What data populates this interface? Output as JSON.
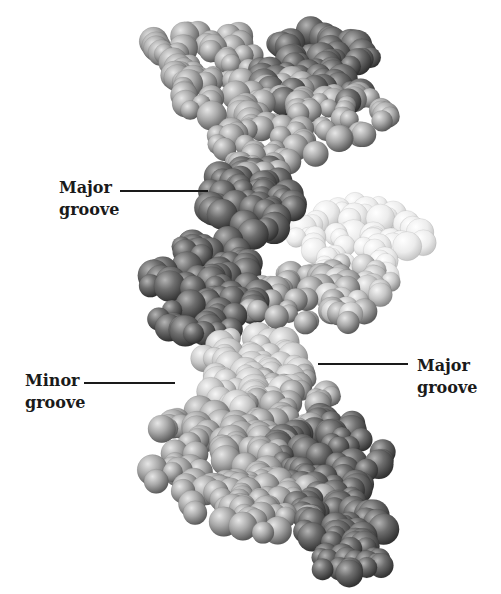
{
  "figure": {
    "colors": {
      "strand_dark": "#5a5a5a",
      "strand_mid": "#9a9a9a",
      "strand_light": "#c8c8c8",
      "strand_pale": "#ececec",
      "text": "#1a1a1a",
      "background": "#ffffff"
    }
  },
  "labels": [
    {
      "id": "major-groove-upper",
      "line1": "Major",
      "line2": "groove",
      "side": "left"
    },
    {
      "id": "minor-groove",
      "line1": "Minor",
      "line2": "groove",
      "side": "left"
    },
    {
      "id": "major-groove-lower",
      "line1": "Major",
      "line2": "groove",
      "side": "right"
    }
  ]
}
